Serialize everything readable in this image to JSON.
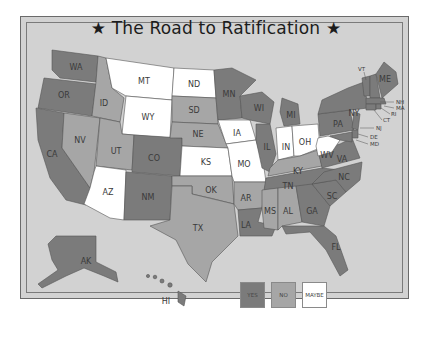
{
  "title": "★ The Road to Ratification ★",
  "colors": {
    "yes": "#7b7b7b",
    "no": "#a6a6a6",
    "maybe": "#ffffff",
    "background": "#d2d2d2"
  },
  "legend": [
    {
      "key": "yes",
      "label": "YES"
    },
    {
      "key": "no",
      "label": "NO"
    },
    {
      "key": "maybe",
      "label": "MAYBE"
    }
  ],
  "states": {
    "yes": [
      "WA",
      "OR",
      "CA",
      "CO",
      "NM",
      "MN",
      "WI",
      "IL",
      "MI",
      "LA",
      "GA",
      "FL",
      "TN",
      "NY",
      "PA",
      "VA",
      "NC",
      "SC",
      "ME",
      "VT",
      "NH",
      "MA",
      "RI",
      "CT",
      "NJ",
      "DE",
      "MD",
      "AK",
      "HI"
    ],
    "no": [
      "ID",
      "NV",
      "UT",
      "SD",
      "NE",
      "OK",
      "TX",
      "AR",
      "MS",
      "AL",
      "KY"
    ],
    "maybe": [
      "MT",
      "ND",
      "WY",
      "KS",
      "IA",
      "MO",
      "IN",
      "OH",
      "WV",
      "AZ"
    ]
  },
  "labels": {
    "WA": "WA",
    "OR": "OR",
    "CA": "CA",
    "NV": "NV",
    "ID": "ID",
    "MT": "MT",
    "WY": "WY",
    "UT": "UT",
    "AZ": "AZ",
    "CO": "CO",
    "NM": "NM",
    "ND": "ND",
    "SD": "SD",
    "NE": "NE",
    "KS": "KS",
    "OK": "OK",
    "TX": "TX",
    "MN": "MN",
    "IA": "IA",
    "MO": "MO",
    "AR": "AR",
    "LA": "LA",
    "WI": "WI",
    "IL": "IL",
    "MI": "MI",
    "IN": "IN",
    "OH": "OH",
    "KY": "KY",
    "TN": "TN",
    "MS": "MS",
    "AL": "AL",
    "GA": "GA",
    "FL": "FL",
    "SC": "SC",
    "NC": "NC",
    "VA": "VA",
    "WV": "WV",
    "PA": "PA",
    "NY": "NY",
    "ME": "ME",
    "VT": "VT",
    "NH": "NH",
    "MA": "MA",
    "RI": "RI",
    "CT": "CT",
    "NJ": "NJ",
    "DE": "DE",
    "MD": "MD",
    "AK": "AK",
    "HI": "HI"
  }
}
